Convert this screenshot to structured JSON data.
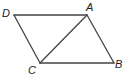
{
  "figure": {
    "type": "parallelogram",
    "stroke_color": "#444444",
    "label_color": "#222222",
    "vertices": {
      "D": {
        "label": "D",
        "x": 14,
        "y": 15,
        "label_x": 2,
        "label_y": 17
      },
      "A": {
        "label": "A",
        "x": 87,
        "y": 15,
        "label_x": 86,
        "label_y": 11
      },
      "B": {
        "label": "B",
        "x": 114,
        "y": 63,
        "label_x": 115,
        "label_y": 68
      },
      "C": {
        "label": "C",
        "x": 40,
        "y": 63,
        "label_x": 28,
        "label_y": 74
      }
    },
    "edges": [
      {
        "name": "edge-DA",
        "from": "D",
        "to": "A"
      },
      {
        "name": "edge-AB",
        "from": "A",
        "to": "B"
      },
      {
        "name": "edge-BC",
        "from": "B",
        "to": "C"
      },
      {
        "name": "edge-CD",
        "from": "C",
        "to": "D"
      },
      {
        "name": "diagonal-AC",
        "from": "A",
        "to": "C"
      }
    ]
  }
}
